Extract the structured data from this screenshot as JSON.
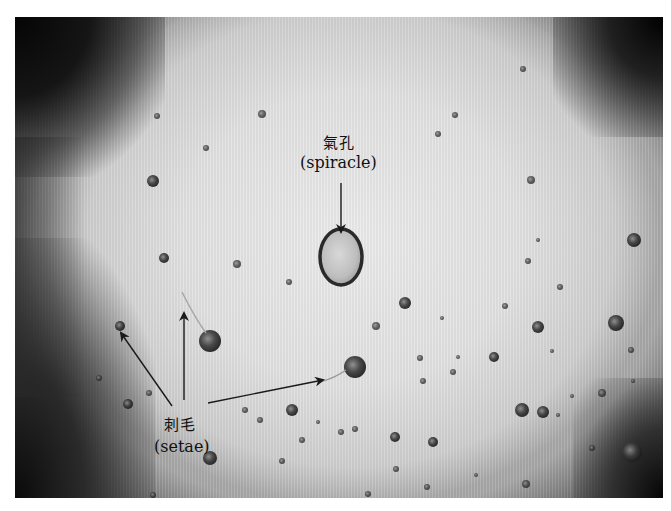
{
  "image": {
    "subject": "microscope view of insect cuticle showing a spiracle and setae sockets",
    "colors": {
      "background": "#e4e4e4",
      "vignette": "#0a0a0a",
      "label_text": "#111111",
      "arrow": "#1a1a1a"
    }
  },
  "labels": {
    "spiracle": {
      "zh": "氣孔",
      "en": "(spiracle)"
    },
    "setae": {
      "zh": "刺毛",
      "en": "(setae)"
    }
  },
  "annotations": {
    "spiracle_arrow": {
      "from": [
        341,
        183
      ],
      "to": [
        341,
        232
      ]
    },
    "setae_arrows": [
      {
        "from": [
          172,
          406
        ],
        "to": [
          121,
          333
        ]
      },
      {
        "from": [
          184,
          400
        ],
        "to": [
          184,
          313
        ]
      },
      {
        "from": [
          208,
          403
        ],
        "to": [
          323,
          380
        ]
      }
    ]
  },
  "features": {
    "spiracle": {
      "cx": 341,
      "cy": 257,
      "rx": 21,
      "ry": 28
    },
    "setae_sockets": [
      {
        "x": 157,
        "y": 116,
        "r": 3
      },
      {
        "x": 206,
        "y": 148,
        "r": 3
      },
      {
        "x": 153,
        "y": 181,
        "r": 6
      },
      {
        "x": 262,
        "y": 114,
        "r": 4
      },
      {
        "x": 164,
        "y": 258,
        "r": 5
      },
      {
        "x": 237,
        "y": 264,
        "r": 4
      },
      {
        "x": 289,
        "y": 282,
        "r": 3
      },
      {
        "x": 523,
        "y": 69,
        "r": 3
      },
      {
        "x": 455,
        "y": 115,
        "r": 3
      },
      {
        "x": 438,
        "y": 134,
        "r": 3
      },
      {
        "x": 531,
        "y": 180,
        "r": 4
      },
      {
        "x": 538,
        "y": 240,
        "r": 2
      },
      {
        "x": 634,
        "y": 240,
        "r": 7
      },
      {
        "x": 528,
        "y": 261,
        "r": 3
      },
      {
        "x": 560,
        "y": 287,
        "r": 3
      },
      {
        "x": 405,
        "y": 303,
        "r": 6
      },
      {
        "x": 505,
        "y": 306,
        "r": 3
      },
      {
        "x": 538,
        "y": 327,
        "r": 6
      },
      {
        "x": 616,
        "y": 323,
        "r": 8
      },
      {
        "x": 210,
        "y": 341,
        "r": 11
      },
      {
        "x": 120,
        "y": 326,
        "r": 5
      },
      {
        "x": 355,
        "y": 367,
        "r": 11
      },
      {
        "x": 423,
        "y": 381,
        "r": 3
      },
      {
        "x": 494,
        "y": 357,
        "r": 5
      },
      {
        "x": 420,
        "y": 358,
        "r": 3
      },
      {
        "x": 543,
        "y": 412,
        "r": 6
      },
      {
        "x": 458,
        "y": 357,
        "r": 2
      },
      {
        "x": 633,
        "y": 381,
        "r": 2
      },
      {
        "x": 602,
        "y": 393,
        "r": 4
      },
      {
        "x": 558,
        "y": 415,
        "r": 2
      },
      {
        "x": 522,
        "y": 410,
        "r": 7
      },
      {
        "x": 592,
        "y": 448,
        "r": 3
      },
      {
        "x": 632,
        "y": 452,
        "r": 10
      },
      {
        "x": 395,
        "y": 437,
        "r": 5
      },
      {
        "x": 433,
        "y": 442,
        "r": 5
      },
      {
        "x": 453,
        "y": 372,
        "r": 3
      },
      {
        "x": 292,
        "y": 410,
        "r": 6
      },
      {
        "x": 128,
        "y": 404,
        "r": 5
      },
      {
        "x": 260,
        "y": 420,
        "r": 3
      },
      {
        "x": 245,
        "y": 410,
        "r": 3
      },
      {
        "x": 210,
        "y": 458,
        "r": 7
      },
      {
        "x": 355,
        "y": 429,
        "r": 3
      },
      {
        "x": 302,
        "y": 440,
        "r": 3
      },
      {
        "x": 318,
        "y": 422,
        "r": 2
      },
      {
        "x": 149,
        "y": 393,
        "r": 3
      },
      {
        "x": 99,
        "y": 378,
        "r": 3
      },
      {
        "x": 376,
        "y": 326,
        "r": 4
      },
      {
        "x": 442,
        "y": 318,
        "r": 2
      },
      {
        "x": 341,
        "y": 432,
        "r": 3
      },
      {
        "x": 282,
        "y": 461,
        "r": 3
      },
      {
        "x": 396,
        "y": 469,
        "r": 3
      },
      {
        "x": 427,
        "y": 487,
        "r": 3
      },
      {
        "x": 526,
        "y": 484,
        "r": 4
      },
      {
        "x": 476,
        "y": 475,
        "r": 2
      },
      {
        "x": 153,
        "y": 495,
        "r": 3
      },
      {
        "x": 368,
        "y": 494,
        "r": 3
      },
      {
        "x": 552,
        "y": 351,
        "r": 2
      },
      {
        "x": 631,
        "y": 350,
        "r": 3
      },
      {
        "x": 572,
        "y": 396,
        "r": 2
      }
    ]
  }
}
